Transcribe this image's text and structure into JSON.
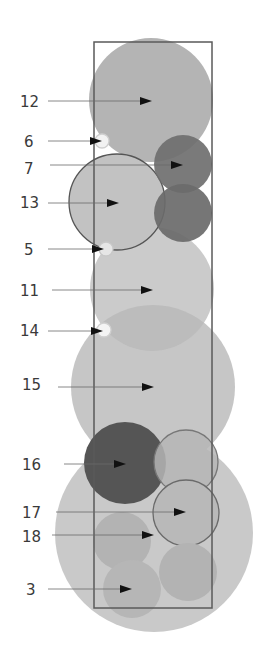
{
  "diagram": {
    "frame": {
      "x": 94,
      "y": 42,
      "width": 118,
      "height": 566,
      "stroke": "#5a5a5a"
    },
    "circles": [
      {
        "id": "c-base",
        "cx": 154,
        "cy": 533,
        "r": 99,
        "fill": "#c9c9c9",
        "opacity": 1,
        "stroke": "none"
      },
      {
        "id": "c-15",
        "cx": 153,
        "cy": 387,
        "r": 82,
        "fill": "#c6c6c6",
        "opacity": 1,
        "stroke": "none"
      },
      {
        "id": "c-11",
        "cx": 152,
        "cy": 289,
        "r": 62,
        "fill": "#cbcbcb",
        "opacity": 1,
        "stroke": "none"
      },
      {
        "id": "c-11-overlap",
        "cx": 152,
        "cy": 289,
        "r": 62,
        "fill": "#bcbcbc",
        "opacity": 1,
        "stroke": "none",
        "clipTo": "c-15"
      },
      {
        "id": "c-12",
        "cx": 151,
        "cy": 100,
        "r": 62,
        "fill": "#b4b4b4",
        "opacity": 1,
        "stroke": "none"
      },
      {
        "id": "c-13",
        "cx": 117,
        "cy": 202,
        "r": 48,
        "fill": "#c2c2c2",
        "opacity": 1,
        "stroke": "#555555"
      },
      {
        "id": "c-7",
        "cx": 183,
        "cy": 164,
        "r": 29,
        "fill": "#6f6f6f",
        "opacity": 0.92,
        "stroke": "none"
      },
      {
        "id": "c-7b",
        "cx": 183,
        "cy": 213,
        "r": 29,
        "fill": "#6a6a6a",
        "opacity": 0.92,
        "stroke": "none"
      },
      {
        "id": "c-16",
        "cx": 125,
        "cy": 463,
        "r": 41,
        "fill": "#555555",
        "opacity": 1,
        "stroke": "none"
      },
      {
        "id": "c-upper-right",
        "cx": 186,
        "cy": 462,
        "r": 32,
        "fill": "#b5b5b5",
        "opacity": 0.85,
        "stroke": "#777777"
      },
      {
        "id": "c-17",
        "cx": 186,
        "cy": 513,
        "r": 33,
        "fill": "#b9b9b9",
        "opacity": 1,
        "stroke": "#6a6a6a"
      },
      {
        "id": "c-18",
        "cx": 122,
        "cy": 541,
        "r": 29,
        "fill": "#b3b3b3",
        "opacity": 1,
        "stroke": "none"
      },
      {
        "id": "c-bottom-right",
        "cx": 188,
        "cy": 572,
        "r": 29,
        "fill": "#b3b3b3",
        "opacity": 1,
        "stroke": "none"
      },
      {
        "id": "c-3",
        "cx": 132,
        "cy": 589,
        "r": 29,
        "fill": "#b6b6b6",
        "opacity": 1,
        "stroke": "none"
      },
      {
        "id": "c-6",
        "cx": 102,
        "cy": 141,
        "r": 7,
        "fill": "#f2f2f2",
        "opacity": 1,
        "stroke": "#cfcfcf"
      },
      {
        "id": "c-5",
        "cx": 106,
        "cy": 249,
        "r": 7,
        "fill": "#e6e6e6",
        "opacity": 1,
        "stroke": "#c8c8c8"
      },
      {
        "id": "c-14",
        "cx": 104,
        "cy": 330,
        "r": 7,
        "fill": "#f4f4f4",
        "opacity": 1,
        "stroke": "#d0d0d0"
      }
    ],
    "callouts": [
      {
        "label": "12",
        "lx": 20,
        "ly": 107,
        "x1": 48,
        "y": 101,
        "x2": 152
      },
      {
        "label": "6",
        "lx": 24,
        "ly": 147,
        "x1": 48,
        "y": 141,
        "x2": 102
      },
      {
        "label": "7",
        "lx": 24,
        "ly": 174,
        "x1": 50,
        "y": 165,
        "x2": 183
      },
      {
        "label": "13",
        "lx": 20,
        "ly": 208,
        "x1": 48,
        "y": 203,
        "x2": 119
      },
      {
        "label": "5",
        "lx": 24,
        "ly": 255,
        "x1": 48,
        "y": 249,
        "x2": 104
      },
      {
        "label": "11",
        "lx": 20,
        "ly": 296,
        "x1": 52,
        "y": 290,
        "x2": 153
      },
      {
        "label": "14",
        "lx": 20,
        "ly": 336,
        "x1": 48,
        "y": 331,
        "x2": 103
      },
      {
        "label": "15",
        "lx": 22,
        "ly": 390,
        "x1": 58,
        "y": 387,
        "x2": 154
      },
      {
        "label": "16",
        "lx": 22,
        "ly": 470,
        "x1": 64,
        "y": 464,
        "x2": 126
      },
      {
        "label": "17",
        "lx": 22,
        "ly": 518,
        "x1": 56,
        "y": 512,
        "x2": 186
      },
      {
        "label": "18",
        "lx": 22,
        "ly": 542,
        "x1": 52,
        "y": 535,
        "x2": 154
      },
      {
        "label": "3",
        "lx": 26,
        "ly": 595,
        "x1": 48,
        "y": 589,
        "x2": 132
      }
    ]
  }
}
